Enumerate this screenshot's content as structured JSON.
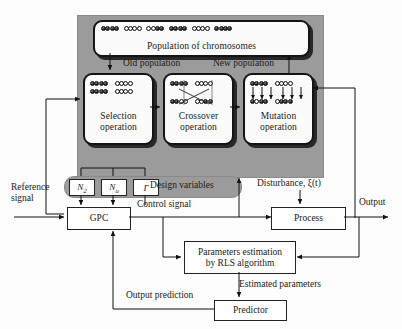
{
  "diagram": {
    "panel_color": "#9b9b9b"
  },
  "ga_panel": {
    "population_box": {
      "label": "Population of chromosomes"
    },
    "flow_labels": {
      "old_population": "Old population",
      "new_population": "New population"
    },
    "operations": [
      {
        "name": "selection",
        "line1": "Selection",
        "line2": "operation"
      },
      {
        "name": "crossover",
        "line1": "Crossover",
        "line2": "operation"
      },
      {
        "name": "mutation",
        "line1": "Mutation",
        "line2": "operation"
      }
    ],
    "chromosomes": {
      "population_row": [
        "dddd",
        "llll",
        "lldd",
        "dddd",
        "llll",
        "dddd"
      ],
      "selection": [
        [
          "dddd",
          "llll"
        ],
        [
          "dddd",
          "llll"
        ]
      ],
      "crossover_top": [
        "dddd",
        "llll"
      ],
      "crossover_bottom": [
        "ddll",
        "lldd"
      ],
      "mutation_top": [
        "dddd",
        "llll"
      ],
      "mutation_bottom": [
        "dldd",
        "lddd"
      ]
    }
  },
  "design_variables": {
    "pill_label": "Design variables",
    "cells": [
      {
        "name": "n2",
        "label": "N",
        "sub": "2"
      },
      {
        "name": "nu",
        "label": "N",
        "sub": "u"
      },
      {
        "name": "gamma",
        "label": "Γ",
        "sub": ""
      }
    ]
  },
  "blocks": {
    "gpc": {
      "label": "GPC"
    },
    "process": {
      "label": "Process"
    },
    "estimator": {
      "line1": "Parameters estimation",
      "line2": "by RLS algorithm"
    },
    "predictor": {
      "label": "Predictor"
    }
  },
  "signals": {
    "reference": {
      "line1": "Reference",
      "line2": "signal"
    },
    "control": "Control signal",
    "disturbance": "Disturbance, ξ(t)",
    "output": "Output",
    "estimated": "Estimated parameters",
    "prediction": "Output prediction"
  }
}
